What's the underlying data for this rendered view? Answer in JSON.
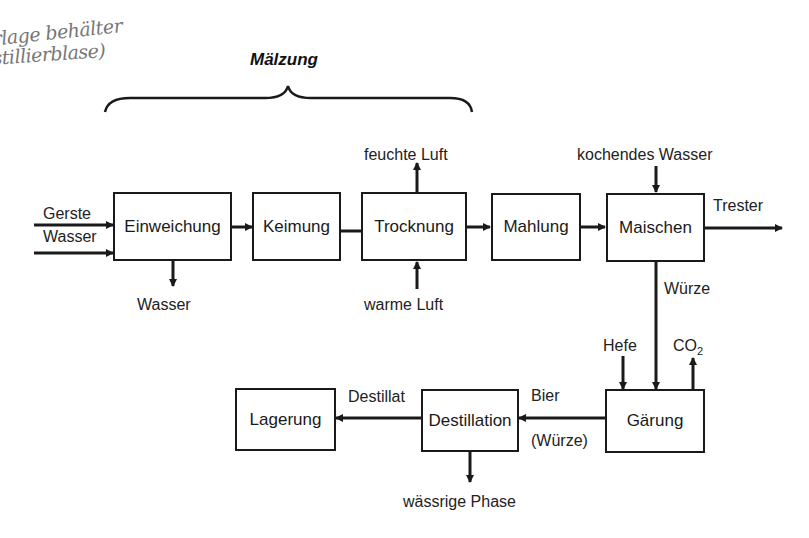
{
  "handwriting": {
    "line1": "Vorlage behälter",
    "line2": "(Destillierblase)"
  },
  "group": {
    "title": "Mälzung"
  },
  "boxes": {
    "einweichung": "Einweichung",
    "keimung": "Keimung",
    "trocknung": "Trocknung",
    "mahlung": "Mahlung",
    "maischen": "Maischen",
    "gaerung": "Gärung",
    "destillation": "Destillation",
    "lagerung": "Lagerung"
  },
  "labels": {
    "gerste": "Gerste",
    "wasser_in": "Wasser",
    "wasser_out": "Wasser",
    "feuchte_luft": "feuchte Luft",
    "warme_luft": "warme Luft",
    "kochendes_wasser": "kochendes Wasser",
    "trester": "Trester",
    "wuerze": "Würze",
    "hefe": "Hefe",
    "co2": "CO",
    "co2_sub": "2",
    "bier": "Bier",
    "wuerze_paren": "(Würze)",
    "destillat": "Destillat",
    "waessrige_phase": "wässrige Phase"
  }
}
